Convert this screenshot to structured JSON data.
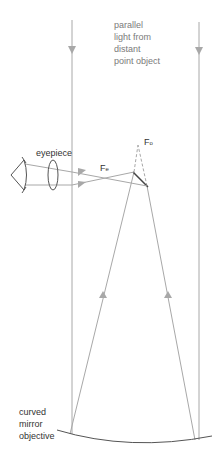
{
  "diagram": {
    "labels": {
      "incoming_light": [
        "parallel",
        "light from",
        "distant",
        "point object"
      ],
      "eyepiece": "eyepiece",
      "fe": {
        "main": "F",
        "sub": "e"
      },
      "fo": {
        "main": "F",
        "sub": "o"
      },
      "objective": [
        "curved",
        "mirror",
        "objective"
      ]
    },
    "colors": {
      "ray": "#a8a8a8",
      "outline": "#555555",
      "text": "#7a7a7a"
    }
  }
}
